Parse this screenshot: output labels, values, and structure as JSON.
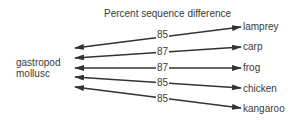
{
  "diagram": {
    "title": "Percent sequence difference",
    "source": {
      "line1": "gastropod",
      "line2": "mollusc"
    },
    "targets": [
      {
        "name": "lamprey",
        "value": "85"
      },
      {
        "name": "carp",
        "value": "87"
      },
      {
        "name": "frog",
        "value": "87"
      },
      {
        "name": "chicken",
        "value": "85"
      },
      {
        "name": "kangaroo",
        "value": "85"
      }
    ],
    "colors": {
      "line": "#333333",
      "text": "#3a3a3a",
      "background": "#ffffff"
    }
  }
}
